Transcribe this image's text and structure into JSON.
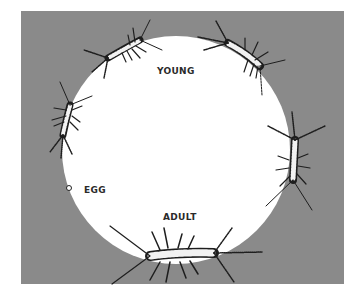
{
  "diagram": {
    "colors": {
      "background": "#ffffff",
      "panel": "#8a8a8a",
      "circle": "#ffffff",
      "ink": "#1e1e1e"
    },
    "labels": {
      "young": "YOUNG",
      "egg": "EGG",
      "adult": "ADULT"
    },
    "stages": [
      {
        "id": "egg",
        "label": "EGG",
        "position": "left"
      },
      {
        "id": "young-1",
        "label": "",
        "position": "left-upper"
      },
      {
        "id": "young-2",
        "label": "",
        "position": "top-left"
      },
      {
        "id": "young-3",
        "label": "",
        "position": "top-right"
      },
      {
        "id": "young-4",
        "label": "",
        "position": "right"
      },
      {
        "id": "adult",
        "label": "ADULT",
        "position": "bottom"
      }
    ]
  }
}
